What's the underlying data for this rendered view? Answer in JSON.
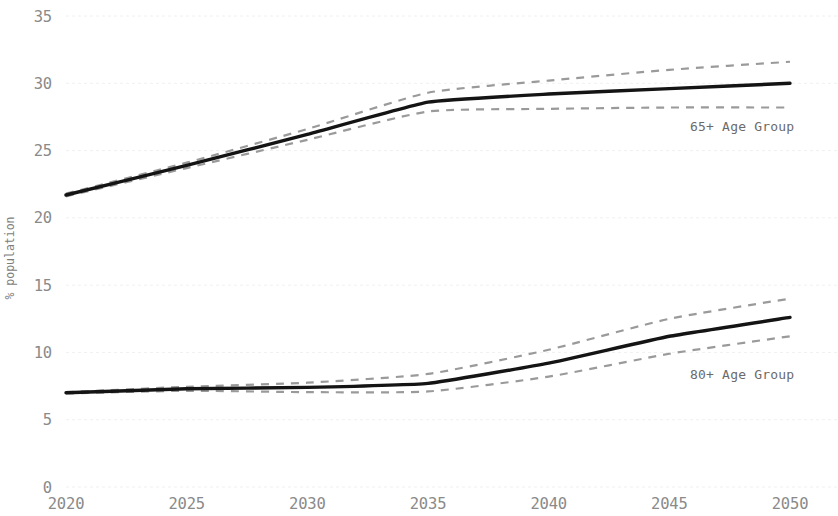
{
  "chart_data": {
    "type": "line",
    "title": "",
    "xlabel": "",
    "ylabel": "% population",
    "xlim": [
      2020,
      2050
    ],
    "ylim": [
      0,
      35
    ],
    "grid": true,
    "legend_position": "inline-annotation",
    "x": [
      2020,
      2025,
      2030,
      2035,
      2040,
      2045,
      2050
    ],
    "x_tick_labels": [
      "2020",
      "2025",
      "2030",
      "2035",
      "2040",
      "2045",
      "2050"
    ],
    "y_tick_labels": [
      "0",
      "5",
      "10",
      "15",
      "20",
      "25",
      "30",
      "35"
    ],
    "y_ticks": [
      0,
      5,
      10,
      15,
      20,
      25,
      30,
      35
    ],
    "series": [
      {
        "name": "65+ Age Group",
        "annotation": "65+ Age Group",
        "style": "solid",
        "color": "#141414",
        "values": [
          21.7,
          23.9,
          26.2,
          28.6,
          29.2,
          29.6,
          30.0
        ],
        "upper_band": [
          21.8,
          24.1,
          26.6,
          29.3,
          30.2,
          31.0,
          31.6
        ],
        "lower_band": [
          21.6,
          23.7,
          25.8,
          27.9,
          28.1,
          28.2,
          28.2
        ],
        "band_style": "dashed",
        "band_color": "#9a9a9a"
      },
      {
        "name": "80+ Age Group",
        "annotation": "80+ Age Group",
        "style": "solid",
        "color": "#141414",
        "values": [
          7.0,
          7.3,
          7.4,
          7.7,
          9.2,
          11.2,
          12.6
        ],
        "upper_band": [
          7.05,
          7.45,
          7.75,
          8.4,
          10.2,
          12.5,
          14.0
        ],
        "lower_band": [
          6.95,
          7.15,
          7.05,
          7.1,
          8.2,
          9.9,
          11.2
        ],
        "band_style": "dashed",
        "band_color": "#9a9a9a"
      }
    ]
  },
  "axes": {
    "y_title": "% population"
  }
}
